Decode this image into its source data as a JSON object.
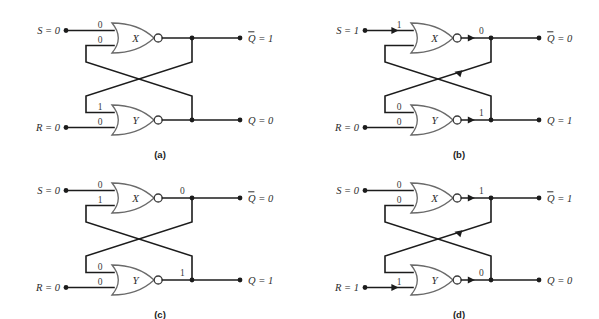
{
  "figure": {
    "background_color": "#ffffff",
    "wire_color": "#1c1c1c",
    "gate_outline_color": "#6a6a6a"
  },
  "panels": [
    {
      "id": "a",
      "caption": "(a)",
      "inputs": {
        "set": {
          "name": "S",
          "label": "S = 0",
          "value": "0",
          "arrow": false
        },
        "reset": {
          "name": "R",
          "label": "R = 0",
          "value": "0",
          "arrow": false
        }
      },
      "gates": [
        {
          "name": "X",
          "label": "X",
          "type": "NOR",
          "input_top": "0",
          "input_bottom": "0",
          "output_bit": "",
          "output_arrow": false
        },
        {
          "name": "Y",
          "label": "Y",
          "type": "NOR",
          "input_top": "1",
          "input_bottom": "0",
          "output_bit": "",
          "output_arrow": false
        }
      ],
      "outputs": {
        "qbar": {
          "name": "Qbar",
          "base": "Q",
          "label": " = 1",
          "value": "1"
        },
        "q": {
          "name": "Q",
          "base": "Q",
          "label": " = 0",
          "value": "0"
        }
      },
      "feedback_arrow_upper": false,
      "feedback_arrow_lower": false
    },
    {
      "id": "b",
      "caption": "(b)",
      "inputs": {
        "set": {
          "name": "S",
          "label": "S = 1",
          "value": "1",
          "arrow": true
        },
        "reset": {
          "name": "R",
          "label": "R = 0",
          "value": "0",
          "arrow": false
        }
      },
      "gates": [
        {
          "name": "X",
          "label": "X",
          "type": "NOR",
          "input_top": "1",
          "input_bottom": "",
          "output_bit": "0",
          "output_arrow": true
        },
        {
          "name": "Y",
          "label": "Y",
          "type": "NOR",
          "input_top": "0",
          "input_bottom": "0",
          "output_bit": "1",
          "output_arrow": true
        }
      ],
      "outputs": {
        "qbar": {
          "name": "Qbar",
          "base": "Q",
          "label": " = 0",
          "value": "0"
        },
        "q": {
          "name": "Q",
          "base": "Q",
          "label": " = 1",
          "value": "1"
        }
      },
      "feedback_arrow_upper": true,
      "feedback_arrow_lower": false
    },
    {
      "id": "c",
      "caption": "(c)",
      "inputs": {
        "set": {
          "name": "S",
          "label": "S = 0",
          "value": "0",
          "arrow": false
        },
        "reset": {
          "name": "R",
          "label": "R = 0",
          "value": "0",
          "arrow": false
        }
      },
      "gates": [
        {
          "name": "X",
          "label": "X",
          "type": "NOR",
          "input_top": "0",
          "input_bottom": "1",
          "output_bit": "0",
          "output_arrow": false
        },
        {
          "name": "Y",
          "label": "Y",
          "type": "NOR",
          "input_top": "0",
          "input_bottom": "0",
          "output_bit": "1",
          "output_arrow": false
        }
      ],
      "outputs": {
        "qbar": {
          "name": "Qbar",
          "base": "Q",
          "label": " = 0",
          "value": "0"
        },
        "q": {
          "name": "Q",
          "base": "Q",
          "label": " = 1",
          "value": "1"
        }
      },
      "feedback_arrow_upper": false,
      "feedback_arrow_lower": false
    },
    {
      "id": "d",
      "caption": "(d)",
      "inputs": {
        "set": {
          "name": "S",
          "label": "S = 0",
          "value": "0",
          "arrow": false
        },
        "reset": {
          "name": "R",
          "label": "R = 1",
          "value": "1",
          "arrow": true
        }
      },
      "gates": [
        {
          "name": "X",
          "label": "X",
          "type": "NOR",
          "input_top": "0",
          "input_bottom": "0",
          "output_bit": "1",
          "output_arrow": true
        },
        {
          "name": "Y",
          "label": "Y",
          "type": "NOR",
          "input_top": "",
          "input_bottom": "1",
          "output_bit": "0",
          "output_arrow": true
        }
      ],
      "outputs": {
        "qbar": {
          "name": "Qbar",
          "base": "Q",
          "label": " = 1",
          "value": "1"
        },
        "q": {
          "name": "Q",
          "base": "Q",
          "label": " = 0",
          "value": "0"
        }
      },
      "feedback_arrow_upper": true,
      "feedback_arrow_lower": false
    }
  ]
}
